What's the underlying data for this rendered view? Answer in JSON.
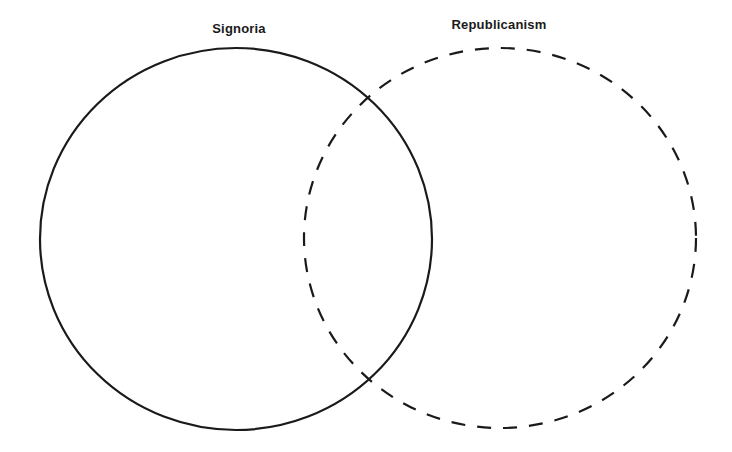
{
  "diagram": {
    "type": "venn",
    "sets": [
      {
        "label": "Signoria",
        "border_style": "solid",
        "stroke_color": "#1a1a1a",
        "center": [
          236,
          239
        ],
        "radius": [
          196,
          191
        ]
      },
      {
        "label": "Republicanism",
        "border_style": "dashed",
        "stroke_color": "#1a1a1a",
        "center": [
          500,
          238
        ],
        "radius": [
          196,
          190
        ]
      }
    ],
    "background": "#ffffff"
  }
}
